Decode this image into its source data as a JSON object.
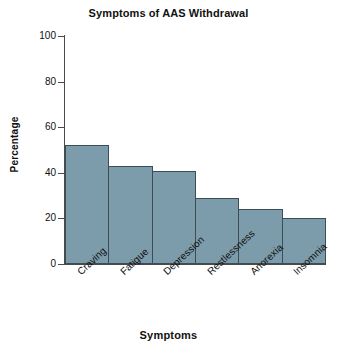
{
  "chart_data": {
    "type": "bar",
    "title": "Symptoms of AAS Withdrawal",
    "xlabel": "Symptoms",
    "ylabel": "Percentage",
    "categories": [
      "Craving",
      "Fatigue",
      "Depression",
      "Restlessness",
      "Anorexia",
      "Insomnia"
    ],
    "values": [
      52,
      43,
      41,
      29,
      24,
      20
    ],
    "ylim": [
      0,
      100
    ],
    "yticks": [
      0,
      20,
      40,
      60,
      80,
      100
    ],
    "ytick_labels": [
      "0",
      "20",
      "40",
      "60",
      "80",
      "100"
    ],
    "grid": false,
    "legend": "none",
    "bar_color": "#7d9cab",
    "bar_edge_color": "#3d4d55",
    "axis_color": "#4a4a4a",
    "background_color": "#ffffff",
    "xtick_label_rotation": -43
  }
}
